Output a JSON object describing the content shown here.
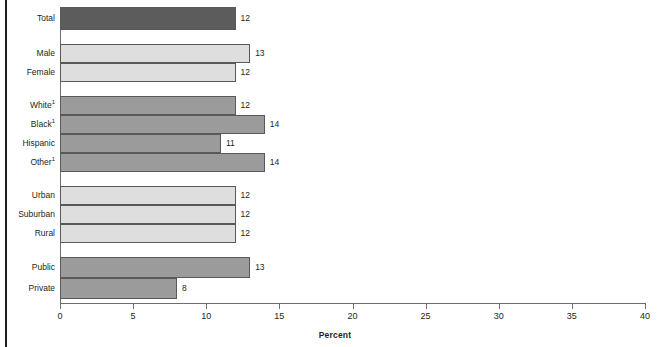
{
  "chart_data": {
    "type": "bar",
    "orientation": "horizontal",
    "title": "",
    "subtitle": "",
    "xlabel": "Percent",
    "ylabel": "",
    "xlim": [
      0,
      40
    ],
    "xticks": [
      0,
      5,
      10,
      15,
      20,
      25,
      30,
      35,
      40
    ],
    "xtick_labels": [
      "0",
      "5",
      "10",
      "15",
      "20",
      "25",
      "30",
      "35",
      "40"
    ],
    "grid": false,
    "legend": null,
    "categories": [
      "Total",
      "Male",
      "Female",
      "White¹",
      "Black¹",
      "Hispanic",
      "Other¹",
      "Urban",
      "Suburban",
      "Rural",
      "Public",
      "Private"
    ],
    "values": [
      12,
      13,
      12,
      12,
      14,
      11,
      14,
      12,
      12,
      12,
      13,
      8
    ],
    "data_labels": [
      "12",
      "13",
      "12",
      "12",
      "14",
      "11",
      "14",
      "12",
      "12",
      "12",
      "13",
      "8"
    ],
    "groups": [
      {
        "name": "Total",
        "categories": [
          "Total"
        ],
        "color": "#5c5c5c"
      },
      {
        "name": "Sex",
        "categories": [
          "Male",
          "Female"
        ],
        "color": "#dedede"
      },
      {
        "name": "Race/ethnicity",
        "categories": [
          "White¹",
          "Black¹",
          "Hispanic",
          "Other¹"
        ],
        "color": "#9b9b9b"
      },
      {
        "name": "Locale",
        "categories": [
          "Urban",
          "Suburban",
          "Rural"
        ],
        "color": "#dedede"
      },
      {
        "name": "School type",
        "categories": [
          "Public",
          "Private"
        ],
        "color": "#9b9b9b"
      }
    ],
    "colors": {
      "total_bar": "#5c5c5c",
      "mid_bar": "#9b9b9b",
      "light_bar": "#dedede",
      "bar_outline": "#58595b",
      "axis": "#6d6e71",
      "text": "#231f20"
    }
  },
  "bars": [
    {
      "label": "Total",
      "label_base": "Total",
      "superscript": "",
      "value": 12,
      "value_text": "12",
      "shade": "dark",
      "top": 7,
      "height": 23
    },
    {
      "label": "Male",
      "label_base": "Male",
      "superscript": "",
      "value": 13,
      "value_text": "13",
      "shade": "light",
      "top": 44,
      "height": 19
    },
    {
      "label": "Female",
      "label_base": "Female",
      "superscript": "",
      "value": 12,
      "value_text": "12",
      "shade": "light",
      "top": 63,
      "height": 19
    },
    {
      "label": "White",
      "label_base": "White",
      "superscript": "1",
      "value": 12,
      "value_text": "12",
      "shade": "mid",
      "top": 96,
      "height": 19
    },
    {
      "label": "Black",
      "label_base": "Black",
      "superscript": "1",
      "value": 14,
      "value_text": "14",
      "shade": "mid",
      "top": 115,
      "height": 19
    },
    {
      "label": "Hispanic",
      "label_base": "Hispanic",
      "superscript": "",
      "value": 11,
      "value_text": "11",
      "shade": "mid",
      "top": 134,
      "height": 19
    },
    {
      "label": "Other",
      "label_base": "Other",
      "superscript": "1",
      "value": 14,
      "value_text": "14",
      "shade": "mid",
      "top": 153,
      "height": 19
    },
    {
      "label": "Urban",
      "label_base": "Urban",
      "superscript": "",
      "value": 12,
      "value_text": "12",
      "shade": "light",
      "top": 186,
      "height": 19
    },
    {
      "label": "Suburban",
      "label_base": "Suburban",
      "superscript": "",
      "value": 12,
      "value_text": "12",
      "shade": "light",
      "top": 205,
      "height": 19
    },
    {
      "label": "Rural",
      "label_base": "Rural",
      "superscript": "",
      "value": 12,
      "value_text": "12",
      "shade": "light",
      "top": 224,
      "height": 19
    },
    {
      "label": "Public",
      "label_base": "Public",
      "superscript": "",
      "value": 13,
      "value_text": "13",
      "shade": "mid",
      "top": 257,
      "height": 21
    },
    {
      "label": "Private",
      "label_base": "Private",
      "superscript": "",
      "value": 8,
      "value_text": "8",
      "shade": "mid",
      "top": 278,
      "height": 21
    }
  ],
  "axis": {
    "title": "Percent",
    "ticks": [
      {
        "value": 0,
        "text": "0"
      },
      {
        "value": 5,
        "text": "5"
      },
      {
        "value": 10,
        "text": "10"
      },
      {
        "value": 15,
        "text": "15"
      },
      {
        "value": 20,
        "text": "20"
      },
      {
        "value": 25,
        "text": "25"
      },
      {
        "value": 30,
        "text": "30"
      },
      {
        "value": 35,
        "text": "35"
      },
      {
        "value": 40,
        "text": "40"
      }
    ]
  },
  "geometry": {
    "origin_x": 60,
    "px_per_unit": 14.625,
    "label_right_edge": 55,
    "value_gap": 5
  }
}
